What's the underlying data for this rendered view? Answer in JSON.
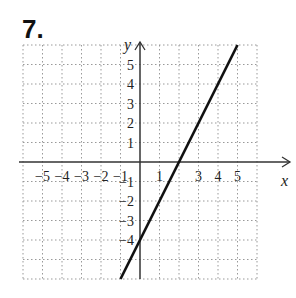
{
  "problem_number": "7.",
  "chart_data": {
    "type": "line",
    "title": "",
    "xlabel": "x",
    "ylabel": "y",
    "xlim": [
      -6,
      6
    ],
    "ylim": [
      -6,
      6
    ],
    "grid": true,
    "x_ticks": [
      "-5",
      "-4",
      "-3",
      "-2",
      "-1",
      "1",
      "3",
      "4",
      "5"
    ],
    "y_ticks": [
      "5",
      "4",
      "3",
      "2",
      "1",
      "-1",
      "-2",
      "-3",
      "-4"
    ],
    "series": [
      {
        "name": "line",
        "equation": "y = 2x - 4",
        "x": [
          -1,
          5
        ],
        "y": [
          -6,
          6
        ]
      }
    ],
    "intercepts": {
      "x": 2,
      "y": -4
    }
  }
}
